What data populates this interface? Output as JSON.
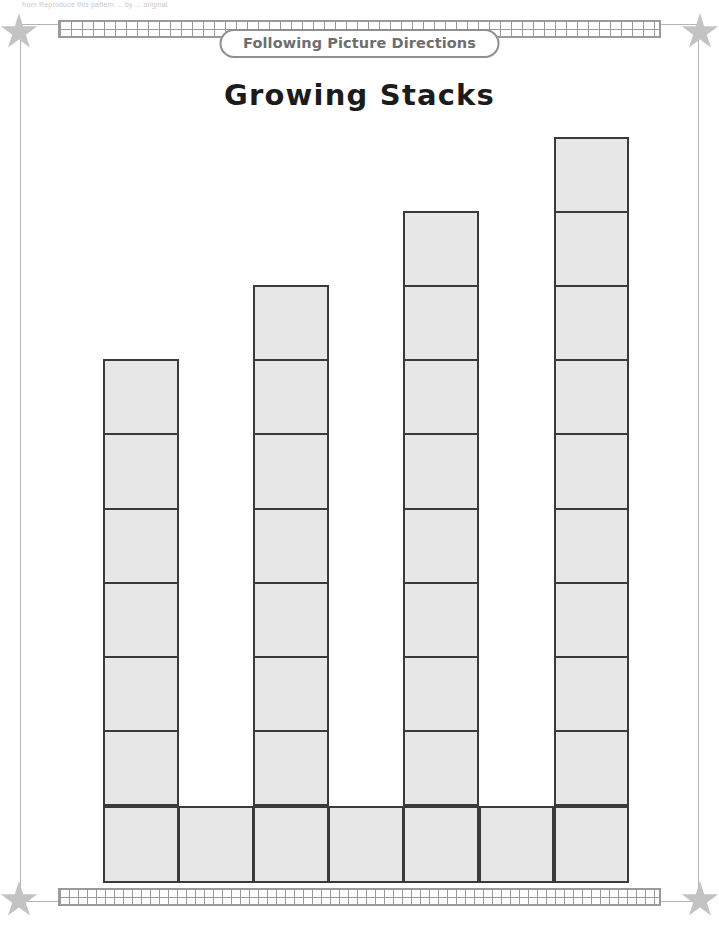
{
  "page": {
    "top_crop_text": "from Reproduce this pattern  ...  by  ...  original",
    "banner_label": "Following Picture Directions",
    "title": "Growing Stacks",
    "star_icon": "star-icon",
    "ruler_icon": "ruler-strip-icon",
    "frame_color": "#b5b5b5",
    "accent_gray": "#9a9a9a",
    "star_color": "#c3c3c3",
    "cube_fill": "#e7e7e7",
    "cube_border": "#3a3a3a",
    "title_color": "#1b1b1b"
  },
  "chart_data": {
    "type": "bar",
    "title": "Growing Stacks",
    "xlabel": "",
    "ylabel": "",
    "categories": [
      "1",
      "2",
      "3",
      "4",
      "5",
      "6",
      "7"
    ],
    "values": [
      7,
      1,
      8,
      1,
      9,
      1,
      10
    ],
    "ylim": [
      0,
      10
    ],
    "grid": false,
    "legend": null
  }
}
